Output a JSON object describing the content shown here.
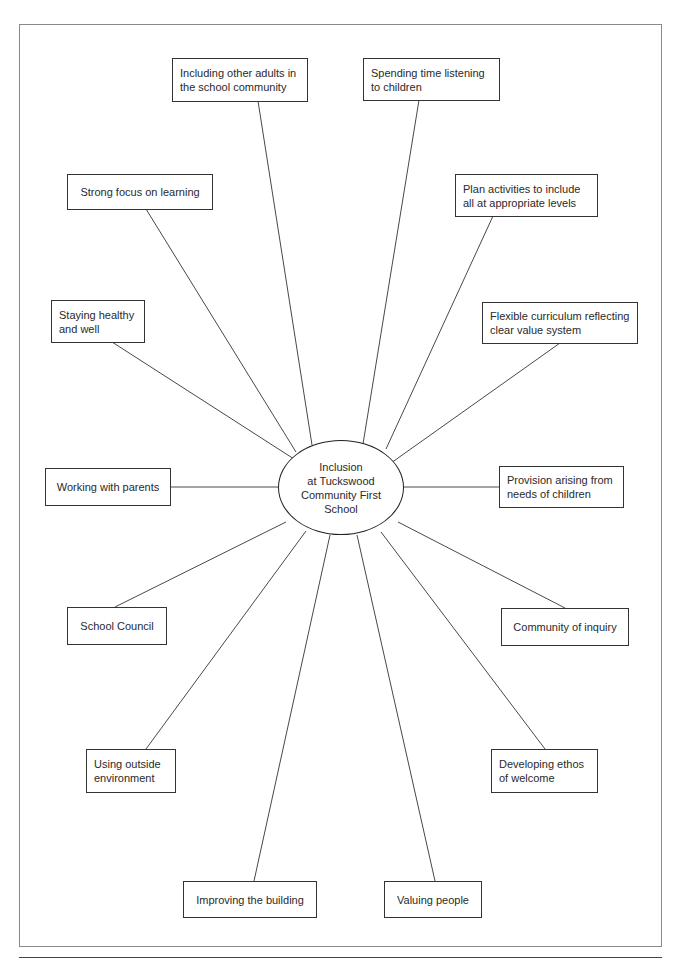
{
  "diagram": {
    "hub": {
      "label": "Inclusion\nat Tuckswood\nCommunity First\nSchool"
    },
    "nodes": [
      {
        "id": "including-adults",
        "label": "Including other adults in\nthe school community"
      },
      {
        "id": "spending-time",
        "label": "Spending time listening\nto children"
      },
      {
        "id": "strong-focus",
        "label": "Strong focus on learning"
      },
      {
        "id": "plan-activities",
        "label": "Plan activities to include\nall at appropriate levels"
      },
      {
        "id": "staying-healthy",
        "label": "Staying healthy\nand well"
      },
      {
        "id": "flexible-curriculum",
        "label": "Flexible curriculum reflecting\nclear value system"
      },
      {
        "id": "working-parents",
        "label": "Working with parents"
      },
      {
        "id": "provision-needs",
        "label": "Provision arising from\nneeds of children"
      },
      {
        "id": "school-council",
        "label": "School Council"
      },
      {
        "id": "community-inquiry",
        "label": "Community of inquiry"
      },
      {
        "id": "using-outside",
        "label": "Using  outside\nenvironment"
      },
      {
        "id": "developing-ethos",
        "label": "Developing  ethos\nof welcome"
      },
      {
        "id": "improving-building",
        "label": "Improving the building"
      },
      {
        "id": "valuing-people",
        "label": "Valuing people"
      }
    ],
    "colors": {
      "frame": "#8a8a8a",
      "box_border": "#333333",
      "line": "#333333",
      "text": "#2a2a2a"
    }
  }
}
